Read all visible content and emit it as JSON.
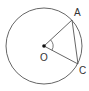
{
  "diagram": {
    "type": "circle-geometry",
    "stroke_color": "#555555",
    "circle": {
      "cx": 44,
      "cy": 46,
      "r": 38
    },
    "center": {
      "label": "O",
      "x": 44,
      "y": 46,
      "label_x": 40,
      "label_y": 61
    },
    "points": [
      {
        "id": "A",
        "label": "A",
        "x": 72,
        "y": 20,
        "label_x": 74,
        "label_y": 16
      },
      {
        "id": "C",
        "label": "C",
        "x": 78,
        "y": 64,
        "label_x": 79,
        "label_y": 74
      }
    ],
    "segments": [
      {
        "from": "O",
        "to": "A",
        "name": "radius-OA"
      },
      {
        "from": "O",
        "to": "C",
        "name": "radius-OC"
      },
      {
        "from": "A",
        "to": "C",
        "name": "chord-AC"
      }
    ],
    "angle_mark": {
      "at": "O",
      "between": [
        "A",
        "C"
      ],
      "radius": 9
    }
  }
}
